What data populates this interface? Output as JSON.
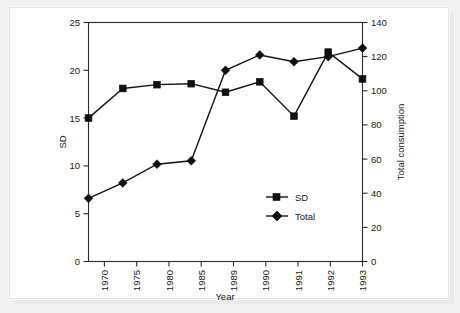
{
  "chart_data": {
    "type": "line",
    "title": "",
    "subtitle": "",
    "xlabel": "Year",
    "ylabel": "SD",
    "y2label": "Total consumption",
    "categories": [
      "1970",
      "1975",
      "1980",
      "1985",
      "1989",
      "1990",
      "1991",
      "1992",
      "1993"
    ],
    "series": [
      {
        "name": "SD",
        "axis": "left",
        "marker": "square",
        "color": "#101010",
        "values": [
          15.0,
          18.1,
          18.5,
          18.6,
          17.7,
          18.8,
          15.2,
          21.9,
          19.1
        ]
      },
      {
        "name": "Total",
        "axis": "right",
        "marker": "diamond",
        "color": "#101010",
        "values": [
          37,
          46,
          57,
          59,
          112,
          121,
          117,
          120,
          125
        ]
      }
    ],
    "ylim": [
      0,
      25
    ],
    "yticks": [
      "0",
      "5",
      "10",
      "15",
      "20",
      "25"
    ],
    "y2lim": [
      0,
      140
    ],
    "y2ticks": [
      "0",
      "20",
      "40",
      "60",
      "80",
      "100",
      "120",
      "140"
    ],
    "grid": false,
    "legend_position": "inside-lower-right",
    "legend": [
      {
        "label": "SD",
        "marker": "square"
      },
      {
        "label": "Total",
        "marker": "diamond"
      }
    ]
  },
  "axes": {
    "x_title": "Year",
    "y_left_title": "SD",
    "y_right_title": "Total consumption",
    "x_tick_labels": [
      "1970",
      "1975",
      "1980",
      "1985",
      "1989",
      "1990",
      "1991",
      "1992",
      "1993"
    ],
    "y_left_tick_labels": [
      "25",
      "20",
      "15",
      "10",
      "5",
      "0"
    ],
    "y_right_tick_labels": [
      "140",
      "120",
      "100",
      "80",
      "60",
      "40",
      "20",
      "0"
    ]
  },
  "legend": {
    "sd_label": "SD",
    "total_label": "Total"
  },
  "colors": {
    "ink": "#141414",
    "card": "#ffffff",
    "page": "#f2f2f2",
    "border": "#e3e3e3"
  }
}
